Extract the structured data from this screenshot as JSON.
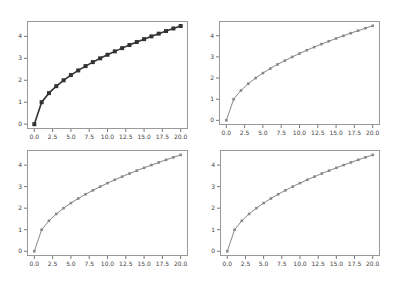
{
  "chart_data": [
    {
      "type": "line",
      "position": "top-left",
      "title": "",
      "xlabel": "",
      "ylabel": "",
      "x": [
        0,
        1,
        2,
        3,
        4,
        5,
        6,
        7,
        8,
        9,
        10,
        11,
        12,
        13,
        14,
        15,
        16,
        17,
        18,
        19,
        20
      ],
      "series": [
        {
          "name": "sqrt(x)",
          "values": [
            0,
            1,
            1.414,
            1.732,
            2,
            2.236,
            2.449,
            2.646,
            2.828,
            3,
            3.162,
            3.317,
            3.464,
            3.606,
            3.742,
            3.873,
            4,
            4.123,
            4.243,
            4.359,
            4.472
          ],
          "color": "#333333",
          "marker": "s",
          "line_width": 1.6
        }
      ],
      "xticks": [
        "0.0",
        "2.5",
        "5.0",
        "7.5",
        "10.0",
        "12.5",
        "15.0",
        "17.5",
        "20.0"
      ],
      "yticks": [
        "0",
        "1",
        "2",
        "3",
        "4"
      ],
      "xlim": [
        -1,
        21
      ],
      "ylim": [
        -0.22,
        4.7
      ],
      "grid": false
    },
    {
      "type": "line",
      "position": "top-right",
      "title": "",
      "xlabel": "",
      "ylabel": "",
      "x": [
        0,
        1,
        2,
        3,
        4,
        5,
        6,
        7,
        8,
        9,
        10,
        11,
        12,
        13,
        14,
        15,
        16,
        17,
        18,
        19,
        20
      ],
      "series": [
        {
          "name": "sqrt(x)",
          "values": [
            0,
            1,
            1.414,
            1.732,
            2,
            2.236,
            2.449,
            2.646,
            2.828,
            3,
            3.162,
            3.317,
            3.464,
            3.606,
            3.742,
            3.873,
            4,
            4.123,
            4.243,
            4.359,
            4.472
          ],
          "color": "#888888",
          "marker": "s",
          "line_width": 1.0
        }
      ],
      "xticks": [
        "0.0",
        "2.5",
        "5.0",
        "7.5",
        "10.0",
        "12.5",
        "15.0",
        "17.5",
        "20.0"
      ],
      "yticks": [
        "0",
        "1",
        "2",
        "3",
        "4"
      ],
      "xlim": [
        -1,
        21
      ],
      "ylim": [
        -0.22,
        4.7
      ],
      "grid": false
    },
    {
      "type": "line",
      "position": "bottom-left",
      "title": "",
      "xlabel": "",
      "ylabel": "",
      "x": [
        0,
        1,
        2,
        3,
        4,
        5,
        6,
        7,
        8,
        9,
        10,
        11,
        12,
        13,
        14,
        15,
        16,
        17,
        18,
        19,
        20
      ],
      "series": [
        {
          "name": "sqrt(x)",
          "values": [
            0,
            1,
            1.414,
            1.732,
            2,
            2.236,
            2.449,
            2.646,
            2.828,
            3,
            3.162,
            3.317,
            3.464,
            3.606,
            3.742,
            3.873,
            4,
            4.123,
            4.243,
            4.359,
            4.472
          ],
          "color": "#888888",
          "marker": "s",
          "line_width": 1.0
        }
      ],
      "xticks": [
        "0.0",
        "2.5",
        "5.0",
        "7.5",
        "10.0",
        "12.5",
        "15.0",
        "17.5",
        "20.0"
      ],
      "yticks": [
        "0",
        "1",
        "2",
        "3",
        "4"
      ],
      "xlim": [
        -1,
        21
      ],
      "ylim": [
        -0.22,
        4.7
      ],
      "grid": false
    },
    {
      "type": "line",
      "position": "bottom-right",
      "title": "",
      "xlabel": "",
      "ylabel": "",
      "x": [
        0,
        1,
        2,
        3,
        4,
        5,
        6,
        7,
        8,
        9,
        10,
        11,
        12,
        13,
        14,
        15,
        16,
        17,
        18,
        19,
        20
      ],
      "series": [
        {
          "name": "sqrt(x)",
          "values": [
            0,
            1,
            1.414,
            1.732,
            2,
            2.236,
            2.449,
            2.646,
            2.828,
            3,
            3.162,
            3.317,
            3.464,
            3.606,
            3.742,
            3.873,
            4,
            4.123,
            4.243,
            4.359,
            4.472
          ],
          "color": "#888888",
          "marker": "s",
          "line_width": 1.0
        }
      ],
      "xticks": [
        "0.0",
        "2.5",
        "5.0",
        "7.5",
        "10.0",
        "12.5",
        "15.0",
        "17.5",
        "20.0"
      ],
      "yticks": [
        "0",
        "1",
        "2",
        "3",
        "4"
      ],
      "xlim": [
        -1,
        21
      ],
      "ylim": [
        -0.22,
        4.7
      ],
      "grid": false
    }
  ],
  "layout": {
    "panels": [
      {
        "left": 27,
        "top": 21,
        "width": 161,
        "height": 108
      },
      {
        "left": 219,
        "top": 21,
        "width": 161,
        "height": 104
      },
      {
        "left": 27,
        "top": 150,
        "width": 161,
        "height": 106
      },
      {
        "left": 220,
        "top": 150,
        "width": 160,
        "height": 106
      }
    ],
    "frame_color": "#999999",
    "tick_color": "#555555"
  }
}
